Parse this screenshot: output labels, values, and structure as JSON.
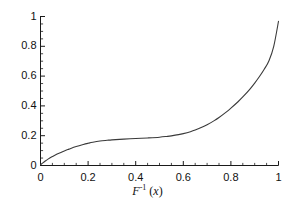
{
  "chart_data": {
    "type": "line",
    "title": "",
    "subtitle": "",
    "xlabel": "F⁻¹ (x)",
    "xlabel_parts": {
      "base": "F",
      "exponent": "-1",
      "argument": "(x)"
    },
    "ylabel": "",
    "xlim": [
      0,
      1
    ],
    "ylim": [
      0,
      1
    ],
    "grid": false,
    "legend": null,
    "line_color": "#3a3a3a",
    "axis_color": "#1a1a1a",
    "background_color": "#ffffff",
    "xticks": [
      0,
      0.2,
      0.4,
      0.6,
      0.8,
      1
    ],
    "xtick_labels": [
      "0",
      "0.2",
      "0.4",
      "0.6",
      "0.8",
      "1"
    ],
    "yticks": [
      0,
      0.2,
      0.4,
      0.6,
      0.8,
      1
    ],
    "ytick_labels": [
      "0",
      "0.2",
      "0.4",
      "0.6",
      "0.8",
      "1"
    ],
    "minor_tick_step": 0.05,
    "series": [
      {
        "name": "F inverse",
        "x": [
          0.0,
          0.01,
          0.02,
          0.03,
          0.05,
          0.07,
          0.1,
          0.12,
          0.15,
          0.18,
          0.2,
          0.22,
          0.25,
          0.28,
          0.3,
          0.35,
          0.4,
          0.45,
          0.5,
          0.53,
          0.55,
          0.58,
          0.6,
          0.63,
          0.65,
          0.68,
          0.7,
          0.73,
          0.75,
          0.78,
          0.8,
          0.83,
          0.85,
          0.88,
          0.9,
          0.92,
          0.94,
          0.96,
          0.98,
          1.0
        ],
        "values": [
          0.005,
          0.018,
          0.03,
          0.041,
          0.06,
          0.077,
          0.098,
          0.11,
          0.127,
          0.141,
          0.149,
          0.156,
          0.164,
          0.169,
          0.172,
          0.177,
          0.181,
          0.185,
          0.19,
          0.195,
          0.199,
          0.207,
          0.214,
          0.227,
          0.238,
          0.258,
          0.274,
          0.301,
          0.322,
          0.358,
          0.385,
          0.428,
          0.46,
          0.513,
          0.553,
          0.597,
          0.646,
          0.703,
          0.8,
          0.968
        ]
      }
    ]
  },
  "axes": {
    "x_tick_labels": [
      "0",
      "0.2",
      "0.4",
      "0.6",
      "0.8",
      "1"
    ],
    "y_tick_labels": [
      "0",
      "0.2",
      "0.4",
      "0.6",
      "0.8",
      "1"
    ]
  }
}
